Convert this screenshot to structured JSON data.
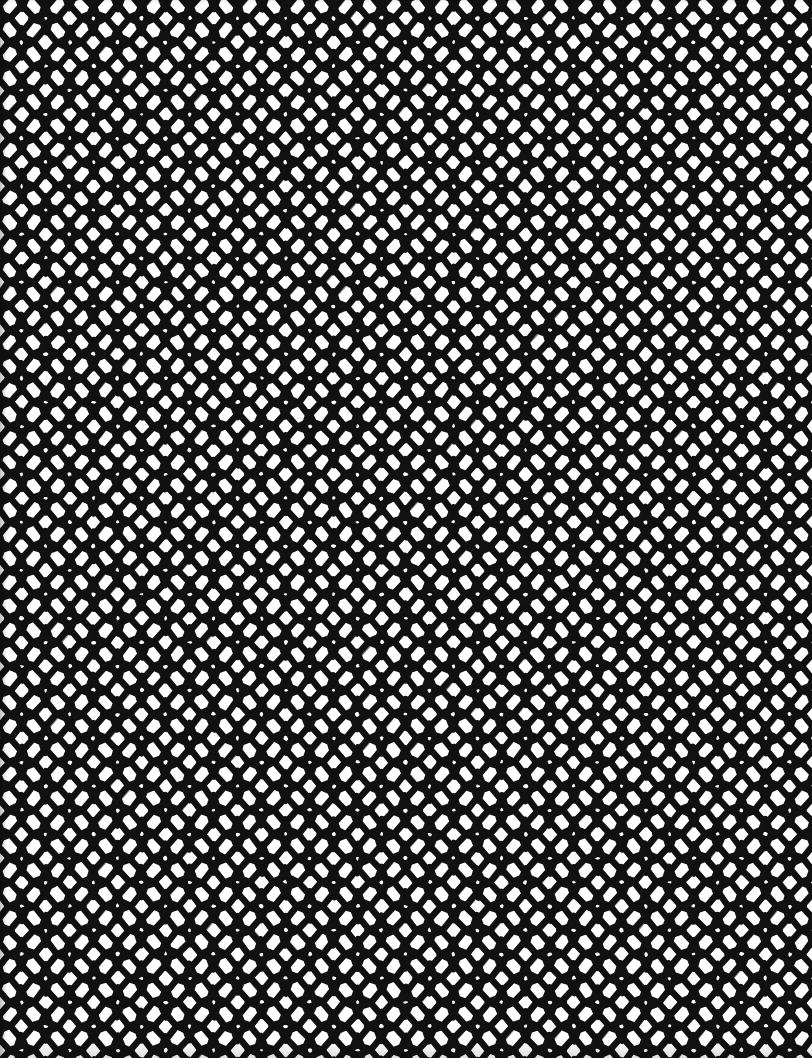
{
  "artwork": {
    "title": "Seamless geometric lattice pattern",
    "kind": "repeating-tile-pattern",
    "motif_name": "rhombus-star-lattice",
    "description": "High-contrast black and white repeating tessellation of rotated squares (diamonds) joined by slender lens-shaped rhombi, forming four-pointed white star voids.",
    "canvas": {
      "width": 812,
      "height": 1058,
      "background_color": "#ffffff",
      "ink_color": "#111111"
    },
    "tile": {
      "period_x": 48,
      "period_y": 48,
      "columns_visible": 17,
      "rows_visible": 22,
      "stroke_width": 6.5,
      "diamond_half_width": 11.5,
      "diamond_half_height": 13.5,
      "lens_half_width": 13.5,
      "lens_half_height": 5.5
    },
    "edges": {
      "left_shadow": true,
      "bottom_shadow": true,
      "top_shadow": true,
      "bleeds_off_all_sides": true
    },
    "palette": {
      "ink": "#111111",
      "paper": "#ffffff",
      "shadow": "#8c8c8c"
    }
  }
}
